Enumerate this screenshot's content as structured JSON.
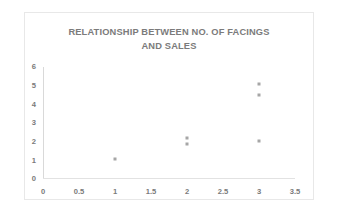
{
  "chart_data": {
    "type": "scatter",
    "title": "RELATIONSHIP BETWEEN NO. OF FACINGS\nAND SALES",
    "title_lines": [
      "RELATIONSHIP BETWEEN NO. OF FACINGS",
      "AND SALES"
    ],
    "xlabel": "",
    "ylabel": "",
    "xlim": [
      0,
      3.5
    ],
    "ylim": [
      0,
      6
    ],
    "xticks": [
      0,
      0.5,
      1,
      1.5,
      2,
      2.5,
      3,
      3.5
    ],
    "xtick_labels": [
      "0",
      "0.5",
      "1",
      "1.5",
      "2",
      "2.5",
      "3",
      "3.5"
    ],
    "yticks": [
      0,
      1,
      2,
      3,
      4,
      5,
      6
    ],
    "ytick_labels": [
      "0",
      "1",
      "2",
      "3",
      "4",
      "5",
      "6"
    ],
    "grid": false,
    "legend": false,
    "legend_position": "none",
    "series": [
      {
        "name": "Sales",
        "marker": "square",
        "marker_color": "#a6a6a6",
        "points": [
          {
            "x": 1,
            "y": 1.05
          },
          {
            "x": 2,
            "y": 2.2
          },
          {
            "x": 2,
            "y": 1.85
          },
          {
            "x": 3,
            "y": 5.1
          },
          {
            "x": 3,
            "y": 4.5
          },
          {
            "x": 3,
            "y": 2.05
          }
        ]
      }
    ]
  },
  "style": {
    "background": "#ffffff",
    "border_color": "#e8e8e8",
    "title_color": "#7b7b7b",
    "tick_color": "#7a7a7a",
    "axis_color": "#d9d9d9"
  }
}
